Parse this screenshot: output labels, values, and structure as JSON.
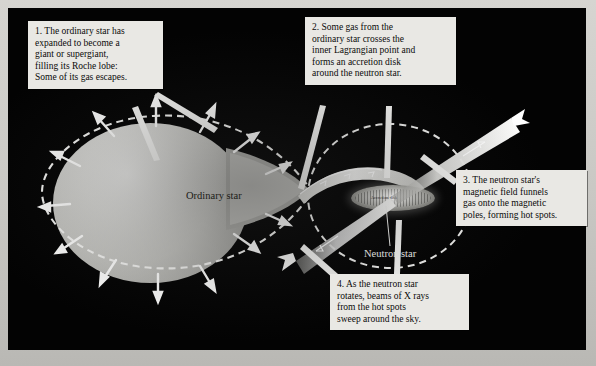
{
  "figure": {
    "plate_background": "#030303",
    "page_background": "#c9c8c4"
  },
  "callouts": [
    {
      "id": "callout-1",
      "number": "1.",
      "text": "1. The ordinary star has expanded to become a giant or supergiant, filling its Roche lobe: Some of its gas escapes.",
      "lines": [
        "1. The ordinary star has",
        "expanded to become a",
        "giant or supergiant,",
        "filling its Roche lobe:",
        "Some of its gas escapes."
      ]
    },
    {
      "id": "callout-2",
      "number": "2.",
      "text": "2. Some gas from the ordinary star crosses the inner Lagrangian point and forms an accretion disk around the neutron star.",
      "lines": [
        "2. Some gas from the",
        "ordinary star crosses the",
        "inner Lagrangian point and",
        "forms an accretion disk",
        "around the neutron star."
      ]
    },
    {
      "id": "callout-3",
      "number": "3.",
      "text": "3. The neutron star's magnetic field funnels gas onto the magnetic poles, forming hot spots.",
      "lines": [
        "3. The neutron star's",
        "magnetic field funnels",
        "gas onto the magnetic",
        "poles, forming hot spots."
      ]
    },
    {
      "id": "callout-4",
      "number": "4.",
      "text": "4. As the neutron star rotates, beams of X rays from the hot spots sweep around the sky.",
      "lines": [
        "4. As the neutron star",
        "rotates, beams of X rays",
        "from the hot spots",
        "sweep around the sky."
      ]
    }
  ],
  "scene_labels": {
    "ordinary_star": "Ordinary star",
    "neutron_star": "Neutron star",
    "accretion_disk": "Accretion disk"
  },
  "colors": {
    "plate": "#030303",
    "callout_bg": "#e9e8e4",
    "callout_text": "#0a0a0a",
    "star_light": "#e8e8e6",
    "star_dark": "#8d8d89",
    "roche_dash": "#f2f2f0",
    "beam": "#f0f0ee",
    "label_dark": "#16160f",
    "label_light": "#f4f4f2"
  }
}
